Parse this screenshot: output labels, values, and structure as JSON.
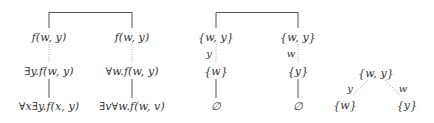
{
  "diagram": {
    "tree1": {
      "root_bracket": true,
      "left": {
        "nodes": [
          "f(w, y)",
          "∃y.f(w, y)",
          "∀x∃y.f(x, y)"
        ],
        "edges": [
          "dotted",
          "solid"
        ]
      },
      "right": {
        "nodes": [
          "f(w, y)",
          "∀w.f(w, y)",
          "∃v∀w.f(w, v)"
        ],
        "edges": [
          "dotted",
          "solid"
        ]
      }
    },
    "tree2": {
      "root_bracket": true,
      "left": {
        "nodes": [
          "{w, y}",
          "{w}",
          "∅"
        ],
        "edge_label": "y",
        "edges": [
          "dotted",
          "solid"
        ]
      },
      "right": {
        "nodes": [
          "{w, y}",
          "{y}",
          "∅"
        ],
        "edge_label": "w",
        "edges": [
          "dotted",
          "solid"
        ]
      }
    },
    "tree3": {
      "root": "{w, y}",
      "children": [
        {
          "node": "{w}",
          "edge_label": "y",
          "edge": "dotted"
        },
        {
          "node": "{y}",
          "edge_label": "w",
          "edge": "dotted"
        }
      ]
    }
  },
  "colors": {
    "line": "#555555",
    "dotted": "#aaaaaa",
    "text": "#333333"
  }
}
